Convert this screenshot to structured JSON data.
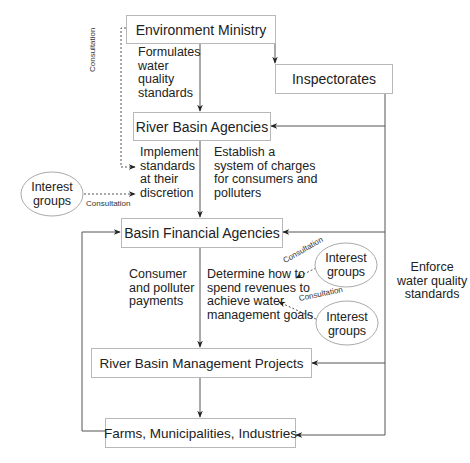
{
  "diagram": {
    "nodes": {
      "environment_ministry": "Environment Ministry",
      "inspectorates": "Inspectorates",
      "river_basin_agencies": "River Basin Agencies",
      "basin_financial_agencies": "Basin Financial Agencies",
      "river_basin_management_projects": "River Basin Management Projects",
      "farms": "Farms, Municipalities, Industries"
    },
    "interest_groups": {
      "left": "Interest\ngroups",
      "right_upper": "Interest\ngroups",
      "right_lower": "Interest\ngroups"
    },
    "edge_labels": {
      "formulates": "Formulates\nwater\nquality\nstandards",
      "implement": "Implement\nstandards\nat their\ndiscretion",
      "establish": "Establish a\nsystem of charges\nfor consumers and\npolluters",
      "payments": "Consumer\nand polluter\npayments",
      "determine": "Determine how to\nspend revenues to\nachieve water\nmanagement goals",
      "enforce": "Enforce\nwater quality\nstandards"
    },
    "consultation_labels": {
      "vertical": "Consultation",
      "left_groups": "Consultation",
      "right_upper": "Consultation",
      "right_lower": "Consultation"
    },
    "colors": {
      "line": "#444444",
      "box_border": "#b8b8b8",
      "ellipse_border": "#aaaaaa"
    }
  }
}
